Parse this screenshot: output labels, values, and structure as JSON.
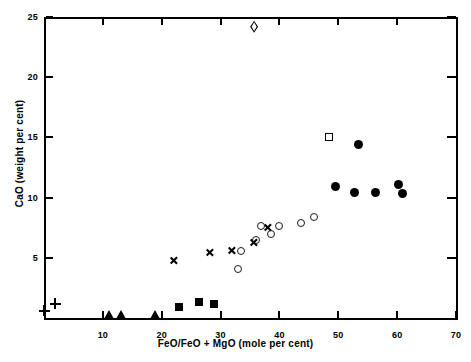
{
  "chart_data": {
    "type": "scatter",
    "title": "",
    "xlabel": "FeO/FeO + MgO (mole per cent)",
    "ylabel": "CaO (weight per cent)",
    "xlim": [
      0,
      70
    ],
    "ylim": [
      0,
      25
    ],
    "xticks": [
      10,
      20,
      30,
      40,
      50,
      60,
      70
    ],
    "yticks": [
      5,
      10,
      15,
      20,
      25
    ],
    "xtick_labels": [
      "10",
      "20",
      "30",
      "40",
      "50",
      "60",
      "70"
    ],
    "ytick_labels": [
      "5",
      "10",
      "15",
      "20",
      "25"
    ],
    "grid": false,
    "legend": "none",
    "series": [
      {
        "name": "plus",
        "marker": "plus",
        "points": [
          {
            "x": 0.0,
            "y": 0.6
          },
          {
            "x": 1.9,
            "y": 1.2
          }
        ]
      },
      {
        "name": "filled-triangle",
        "marker": "filled-triangle",
        "points": [
          {
            "x": 11.2,
            "y": 0.1
          },
          {
            "x": 13.2,
            "y": 0.1
          },
          {
            "x": 19.0,
            "y": 0.1
          }
        ]
      },
      {
        "name": "filled-square",
        "marker": "filled-square",
        "points": [
          {
            "x": 23.0,
            "y": 0.9
          },
          {
            "x": 26.4,
            "y": 1.3
          },
          {
            "x": 28.8,
            "y": 1.2
          }
        ]
      },
      {
        "name": "cross-x",
        "marker": "cross-x",
        "points": [
          {
            "x": 22.1,
            "y": 4.8
          },
          {
            "x": 28.2,
            "y": 5.4
          },
          {
            "x": 31.9,
            "y": 5.6
          },
          {
            "x": 35.7,
            "y": 6.3
          },
          {
            "x": 38.1,
            "y": 7.5
          }
        ]
      },
      {
        "name": "open-circle",
        "marker": "open-circle",
        "points": [
          {
            "x": 33.0,
            "y": 4.1
          },
          {
            "x": 33.5,
            "y": 5.6
          },
          {
            "x": 36.0,
            "y": 6.5
          },
          {
            "x": 36.9,
            "y": 7.6
          },
          {
            "x": 38.5,
            "y": 7.0
          },
          {
            "x": 40.0,
            "y": 7.6
          },
          {
            "x": 43.6,
            "y": 7.9
          },
          {
            "x": 45.8,
            "y": 8.4
          }
        ]
      },
      {
        "name": "filled-circle",
        "marker": "filled-circle",
        "points": [
          {
            "x": 53.5,
            "y": 14.4
          },
          {
            "x": 49.6,
            "y": 10.9
          },
          {
            "x": 52.8,
            "y": 10.4
          },
          {
            "x": 56.4,
            "y": 10.4
          },
          {
            "x": 60.3,
            "y": 11.1
          },
          {
            "x": 60.9,
            "y": 10.3
          }
        ]
      },
      {
        "name": "open-square",
        "marker": "open-square",
        "points": [
          {
            "x": 48.5,
            "y": 15.0
          }
        ]
      },
      {
        "name": "open-diamond",
        "marker": "open-diamond",
        "points": [
          {
            "x": 35.7,
            "y": 24.2
          }
        ]
      }
    ]
  }
}
